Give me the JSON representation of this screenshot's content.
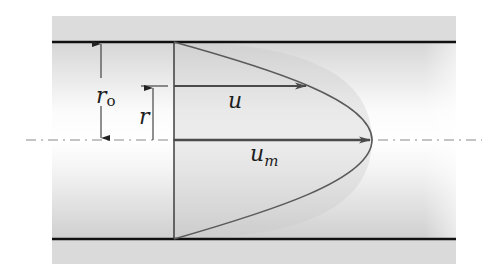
{
  "diagram": {
    "colors": {
      "background": "#ffffff",
      "pipe_band": "#d8d8d8",
      "pipe_interior_edge": "#d2d2d2",
      "pipe_interior_center": "#ffffff",
      "wall_line": "#111111",
      "profile_line": "#5a5a5a",
      "profile_fill": "#cfcfcf",
      "arrow": "#4a4a4a",
      "centerline": "#8a8a8a",
      "dimension": "#222222"
    },
    "labels": {
      "outer_radius": "r",
      "outer_radius_sub": "o",
      "radius": "r",
      "velocity": "u",
      "max_velocity": "u",
      "max_velocity_sub": "m"
    },
    "elements": {
      "pipe_top_wall": "upper pipe wall",
      "pipe_bottom_wall": "lower pipe wall",
      "centerline": "pipe centerline (dash-dot)",
      "reference_plane": "vertical reference cross-section",
      "velocity_profile": "parabolic velocity profile",
      "velocity_arrow_u": "local velocity u at radius r",
      "velocity_arrow_um": "maximum velocity u_m at centerline",
      "dimension_ro": "pipe radius r_o",
      "dimension_r": "radial position r"
    }
  }
}
